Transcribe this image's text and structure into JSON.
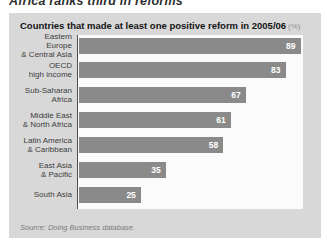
{
  "page_title": "Africa ranks third in reforms",
  "panel": {
    "header": "Countries that made at least one positive reform in 2005/06",
    "header_unit": "(%)",
    "source": "Source: Doing Business database."
  },
  "colors": {
    "panel_bg": "#d8d8d8",
    "plot_bg": "#fbfbfb",
    "bar": "#8a8a8a",
    "axis": "#4d4d4d",
    "value_label": "#ffffff"
  },
  "chart_data": {
    "type": "bar",
    "orientation": "horizontal",
    "categories": [
      "Eastern Europe & Central Asia",
      "OECD high income",
      "Sub-Saharan Africa",
      "Middle East & North Africa",
      "Latin America & Caribbean",
      "East Asia & Pacific",
      "South Asia"
    ],
    "category_lines": [
      [
        "Eastern Europe",
        "& Central Asia"
      ],
      [
        "OECD",
        "high income"
      ],
      [
        "Sub-Saharan",
        "Africa"
      ],
      [
        "Middle East",
        "& North Africa"
      ],
      [
        "Latin America",
        "& Caribbean"
      ],
      [
        "East Asia",
        "& Pacific"
      ],
      [
        "South Asia"
      ]
    ],
    "values": [
      89,
      83,
      67,
      61,
      58,
      35,
      25
    ],
    "xlabel": "",
    "ylabel": "",
    "xlim": [
      0,
      90
    ],
    "value_labels": "inside-end",
    "grid": false,
    "legend": "none",
    "source": "Source: Doing Business database."
  }
}
